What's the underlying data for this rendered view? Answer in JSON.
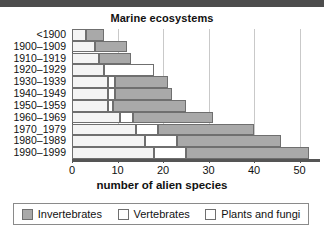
{
  "chart_data": {
    "type": "bar",
    "orientation": "horizontal",
    "stacked": true,
    "title": "Marine ecosystems",
    "xlabel": "number of alien species",
    "ylabel": "",
    "xlim": [
      0,
      52
    ],
    "xticks": [
      0,
      10,
      20,
      30,
      40,
      50
    ],
    "xticklabels": [
      "0",
      "10",
      "20",
      "30",
      "40",
      "50"
    ],
    "grid": "vertical",
    "legend_position": "bottom",
    "categories": [
      "<1900",
      "1900–1909",
      "1910–1919",
      "1920–1929",
      "1930–1939",
      "1940–1949",
      "1950–1959",
      "1960–1969",
      "1970_1979",
      "1980–1989",
      "1990–1999"
    ],
    "series": [
      {
        "name": "Plants and fungi",
        "color": "#f4f4f4",
        "values": [
          3,
          5,
          6,
          7,
          8,
          8,
          8,
          10.5,
          14,
          16,
          18
        ]
      },
      {
        "name": "Vertebrates",
        "color": "#ffffff",
        "values": [
          0,
          0,
          0,
          11,
          1.5,
          1.5,
          1,
          3,
          5,
          7,
          7
        ]
      },
      {
        "name": "Invertebrates",
        "color": "#a9a9a9",
        "values": [
          4,
          7,
          7,
          0,
          11.5,
          12.5,
          16,
          17.5,
          21,
          23,
          27
        ]
      }
    ],
    "totals": [
      7,
      12,
      13,
      18,
      21,
      22,
      25,
      31,
      40,
      46,
      52
    ]
  },
  "legend": {
    "items": [
      {
        "label": "Invertebrates",
        "swatch": "filled-gray-swatch"
      },
      {
        "label": "Vertebrates",
        "swatch": "empty-swatch"
      },
      {
        "label": "Plants and fungi",
        "swatch": "empty-swatch"
      }
    ]
  },
  "colors": {
    "invertebrates": "#a9a9a9",
    "vertebrates": "#ffffff",
    "plants_and_fungi": "#f4f4f4",
    "outline": "#6f6f6f",
    "gridline": "#c9c9c9",
    "axis": "#555555",
    "topbar": "#4d4d4d"
  }
}
